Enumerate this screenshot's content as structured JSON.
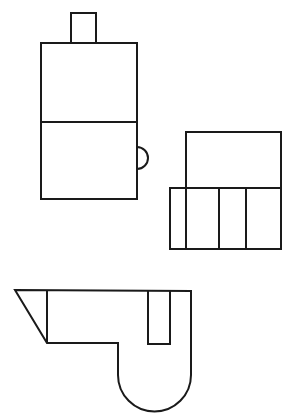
{
  "figure": {
    "type": "three-view orthographic drawing",
    "stroke_color": "#1a1a1a",
    "background": "#ffffff",
    "views": [
      {
        "name": "front-view",
        "description": "tall rectangle split horizontally with small top tab and right semicircle bump"
      },
      {
        "name": "side-view",
        "description": "upper rectangle over lower band divided into four vertical cells"
      },
      {
        "name": "top-view",
        "description": "profile with slanted left end, inner slot, and rounded bottom lobe"
      }
    ]
  }
}
